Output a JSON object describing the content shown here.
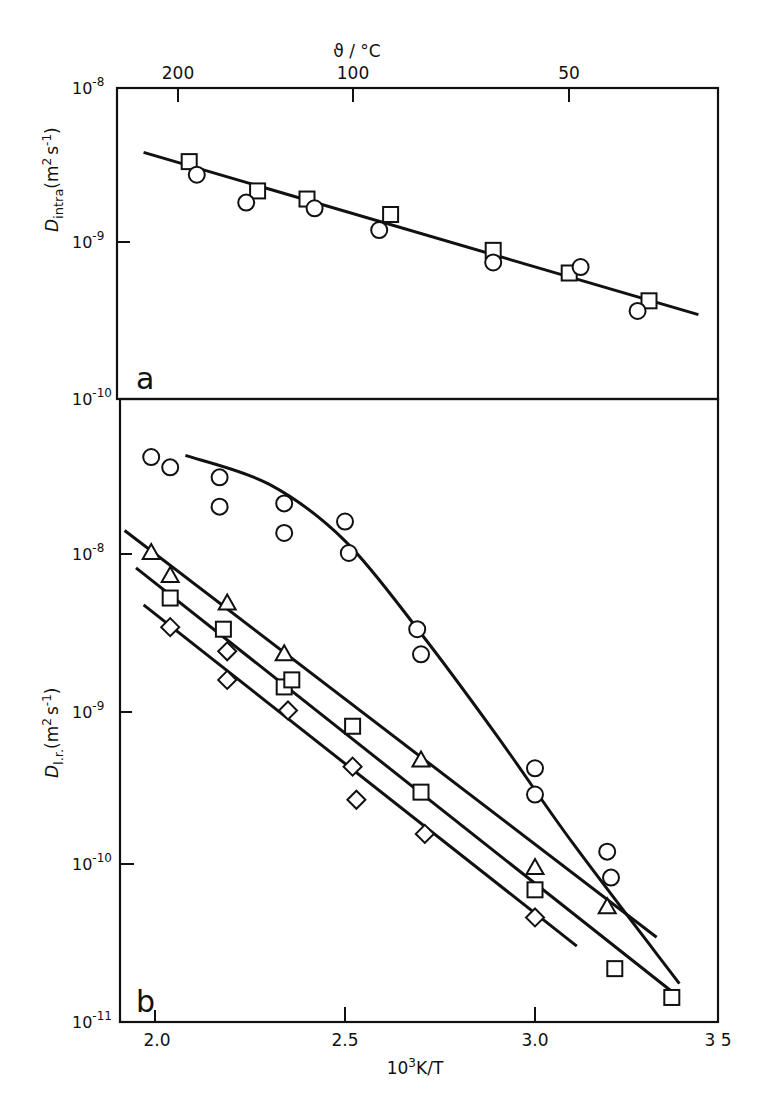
{
  "chart_data": [
    {
      "panel": "a",
      "type": "scatter",
      "title": "",
      "xlabel": "10^3 K/T",
      "ylabel": "D_intra (m^2 s^-1)",
      "top_xlabel": "ϑ / °C",
      "top_xticks": [
        {
          "label": "200",
          "celsius": 200
        },
        {
          "label": "100",
          "celsius": 100
        },
        {
          "label": "50",
          "celsius": 50
        }
      ],
      "yscale": "log",
      "ylim": [
        1e-10,
        1e-08
      ],
      "xlim": [
        1.91,
        3.5
      ],
      "yticks": [
        {
          "label": "10-8",
          "base": "10",
          "exp": "-8",
          "value": 1e-08
        },
        {
          "label": "10-9",
          "base": "10",
          "exp": "-9",
          "value": 1e-09
        },
        {
          "label": "10-10",
          "base": "10",
          "exp": "-10",
          "value": 1e-10
        }
      ],
      "series": [
        {
          "name": "squares",
          "marker": "square",
          "x": [
            2.09,
            2.27,
            2.4,
            2.62,
            2.89,
            3.09,
            3.3
          ],
          "y": [
            3.4e-09,
            2.2e-09,
            1.95e-09,
            1.55e-09,
            9.1e-10,
            6.5e-10,
            4.3e-10
          ]
        },
        {
          "name": "circles",
          "marker": "circle",
          "x": [
            2.11,
            2.24,
            2.42,
            2.59,
            2.89,
            3.12,
            3.27
          ],
          "y": [
            2.8e-09,
            1.85e-09,
            1.7e-09,
            1.23e-09,
            7.6e-10,
            7.1e-10,
            3.7e-10
          ]
        }
      ],
      "fit_lines": [
        {
          "name": "fit",
          "x": [
            1.97,
            3.43
          ],
          "y": [
            3.9e-09,
            3.5e-10
          ]
        }
      ],
      "panel_label": "a"
    },
    {
      "panel": "b",
      "type": "scatter",
      "title": "",
      "xlabel": "10^3 K/T",
      "ylabel": "D_l.r. (m^2 s^-1)",
      "yscale": "log",
      "ylim": [
        1e-11,
        1e-07
      ],
      "xlim": [
        1.91,
        3.5
      ],
      "xticks": [
        {
          "label": "2.0",
          "value": 2.0
        },
        {
          "label": "2.5",
          "value": 2.5
        },
        {
          "label": "3.0",
          "value": 3.0
        },
        {
          "label": "3 5",
          "value": 3.5
        }
      ],
      "yticks": [
        {
          "label": "10-8",
          "base": "10",
          "exp": "-8",
          "value": 1e-08
        },
        {
          "label": "10-9",
          "base": "10",
          "exp": "-9",
          "value": 1e-09
        },
        {
          "label": "10-10",
          "base": "10",
          "exp": "-10",
          "value": 1e-10
        },
        {
          "label": "10-11",
          "base": "10",
          "exp": "-11",
          "value": 1e-11
        }
      ],
      "series": [
        {
          "name": "circles",
          "marker": "circle",
          "x": [
            1.99,
            2.04,
            2.17,
            2.17,
            2.34,
            2.34,
            2.5,
            2.51,
            2.69,
            2.7,
            3.0,
            3.0,
            3.19,
            3.2
          ],
          "y": [
            4.2e-08,
            3.6e-08,
            3.1e-08,
            2e-08,
            2.1e-08,
            1.35e-08,
            1.6e-08,
            1e-08,
            3.2e-09,
            2.2e-09,
            4e-10,
            2.7e-10,
            1.15e-10,
            7.8e-11
          ]
        },
        {
          "name": "triangles",
          "marker": "triangle",
          "x": [
            1.99,
            2.04,
            2.19,
            2.34,
            2.7,
            3.0,
            3.19
          ],
          "y": [
            1e-08,
            7.1e-09,
            4.7e-09,
            2.2e-09,
            4.5e-10,
            9e-11,
            5e-11
          ]
        },
        {
          "name": "squares",
          "marker": "square",
          "x": [
            2.04,
            2.18,
            2.34,
            2.36,
            2.52,
            2.7,
            3.0,
            3.21,
            3.36
          ],
          "y": [
            5.1e-09,
            3.2e-09,
            1.35e-09,
            1.5e-09,
            7.5e-10,
            2.8e-10,
            6.5e-11,
            2e-11,
            1.3e-11
          ]
        },
        {
          "name": "diamonds",
          "marker": "diamond",
          "x": [
            2.04,
            2.19,
            2.19,
            2.35,
            2.52,
            2.53,
            2.71,
            3.0
          ],
          "y": [
            3.3e-09,
            2.3e-09,
            1.5e-09,
            9.5e-10,
            4.1e-10,
            2.5e-10,
            1.5e-10,
            4.3e-11
          ]
        }
      ],
      "fit_lines": [
        {
          "name": "circles-curve",
          "x": [
            2.08,
            2.3,
            2.5,
            2.7,
            2.9,
            3.1,
            3.38
          ],
          "y": [
            4.3e-08,
            2.8e-08,
            1.2e-08,
            3e-09,
            6.5e-10,
            1.3e-10,
            1.6e-11
          ]
        },
        {
          "name": "triangles-fit",
          "x": [
            1.92,
            3.32
          ],
          "y": [
            1.4e-08,
            3.2e-11
          ]
        },
        {
          "name": "squares-fit",
          "x": [
            1.95,
            3.38
          ],
          "y": [
            8e-09,
            1.3e-11
          ]
        },
        {
          "name": "diamonds-fit",
          "x": [
            1.97,
            3.11
          ],
          "y": [
            4.6e-09,
            2.8e-11
          ]
        }
      ],
      "panel_label": "b"
    }
  ],
  "labels": {
    "top_axis_title": "ϑ / °C",
    "top_ticks": [
      "200",
      "100",
      "50"
    ],
    "bottom_axis_title_base": "10",
    "bottom_axis_title_exp": "3",
    "bottom_axis_title_rest": "K/T",
    "bottom_ticks": [
      "2.0",
      "2.5",
      "3.0",
      "3 5"
    ],
    "panel_a_ylabel_D": "D",
    "panel_a_ylabel_sub": "intra",
    "panel_a_ylabel_units": "(m",
    "panel_a_ylabel_units2": "s",
    "panel_a_ylabel_units3": ")",
    "panel_b_ylabel_D": "D",
    "panel_b_ylabel_sub": "l.r.",
    "panel_a_letter": "a",
    "panel_b_letter": "b",
    "ytick_base": "10",
    "panel_a_ytick_exps": [
      "-8",
      "-9",
      "-10"
    ],
    "panel_b_ytick_exps": [
      "-8",
      "-9",
      "-10",
      "-11"
    ],
    "exp_2": "2",
    "exp_m1": "-1"
  }
}
